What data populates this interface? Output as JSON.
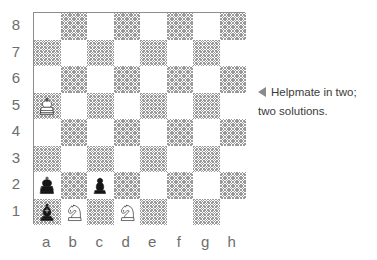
{
  "diagram": {
    "type": "chess-board-diagram",
    "board": {
      "files": [
        "a",
        "b",
        "c",
        "d",
        "e",
        "f",
        "g",
        "h"
      ],
      "ranks": [
        "8",
        "7",
        "6",
        "5",
        "4",
        "3",
        "2",
        "1"
      ],
      "orientation": "white-bottom",
      "light_square_color": "#ffffff",
      "dark_square_color": "#9a9a9a",
      "dark_square_style": "cross-hatch",
      "border_color": "#8d8d8d",
      "label_color": "#6e6e6e",
      "a8_is_light": true
    },
    "pieces": [
      {
        "square": "a5",
        "color": "white",
        "type": "king",
        "glyph": "♔",
        "name": "white-king-a5"
      },
      {
        "square": "a2",
        "color": "black",
        "type": "king",
        "glyph": "♚",
        "name": "black-king-a2"
      },
      {
        "square": "a1",
        "color": "black",
        "type": "bishop",
        "glyph": "♝",
        "name": "black-bishop-a1"
      },
      {
        "square": "c2",
        "color": "black",
        "type": "pawn",
        "glyph": "♟",
        "name": "black-pawn-c2"
      },
      {
        "square": "b1",
        "color": "white",
        "type": "knight",
        "glyph": "♘",
        "name": "white-knight-b1"
      },
      {
        "square": "d1",
        "color": "white",
        "type": "knight",
        "glyph": "♘",
        "name": "white-knight-d1"
      }
    ]
  },
  "caption": {
    "marker": "◀",
    "line1": "Helpmate in two;",
    "line2": "two solutions.",
    "text_color": "#3b3b3b",
    "marker_color": "#8a8a8a"
  }
}
